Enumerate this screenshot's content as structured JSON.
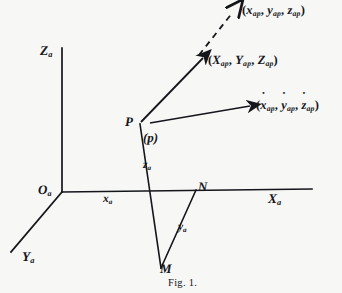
{
  "figure": {
    "caption": "Fig. 1.",
    "background_color": "#f7f7f6",
    "ink_color": "#15161a"
  },
  "axes": [
    {
      "id": "z",
      "label_base": "Z",
      "label_sub": "a",
      "x": 40,
      "y": 44
    },
    {
      "id": "x",
      "label_base": "X",
      "label_sub": "a",
      "x": 268,
      "y": 192
    },
    {
      "id": "y",
      "label_base": "Y",
      "label_sub": "a",
      "x": 22,
      "y": 250
    }
  ],
  "points": [
    {
      "id": "origin",
      "label": "O",
      "sub": "a",
      "x": 38,
      "y": 183
    },
    {
      "id": "p",
      "label": "P",
      "sub": "",
      "x": 125,
      "y": 115
    },
    {
      "id": "p-lower",
      "label": "(p)",
      "sub": "",
      "x": 143,
      "y": 131
    },
    {
      "id": "n",
      "label": "N",
      "sub": "",
      "x": 198,
      "y": 180
    },
    {
      "id": "m",
      "label": "M",
      "sub": "",
      "x": 160,
      "y": 262
    }
  ],
  "components": [
    {
      "id": "xa",
      "base": "x",
      "sub": "a",
      "x": 103,
      "y": 194
    },
    {
      "id": "za",
      "base": "z",
      "sub": "a",
      "x": 143,
      "y": 160
    },
    {
      "id": "ya",
      "base": "y",
      "sub": "a",
      "x": 178,
      "y": 222
    }
  ],
  "vectors": [
    {
      "id": "acceleration",
      "style": "dashed",
      "label_x": 242,
      "label_y": 4,
      "parts": [
        {
          "base": "x",
          "sub": "ap",
          "dots": 2
        },
        {
          "base": "y",
          "sub": "ap",
          "dots": 2
        },
        {
          "base": "z",
          "sub": "ap",
          "dots": 2
        }
      ]
    },
    {
      "id": "position",
      "style": "solid",
      "label_x": 208,
      "label_y": 54,
      "parts": [
        {
          "base": "X",
          "sub": "ap",
          "dots": 0
        },
        {
          "base": "Y",
          "sub": "ap",
          "dots": 0
        },
        {
          "base": "Z",
          "sub": "ap",
          "dots": 0
        }
      ]
    },
    {
      "id": "velocity",
      "style": "solid",
      "label_x": 256,
      "label_y": 99,
      "parts": [
        {
          "base": "x",
          "sub": "ap",
          "dots": 1
        },
        {
          "base": "y",
          "sub": "ap",
          "dots": 1
        },
        {
          "base": "z",
          "sub": "ap",
          "dots": 1
        }
      ]
    }
  ],
  "caption_pos": {
    "x": 168,
    "y": 277
  }
}
